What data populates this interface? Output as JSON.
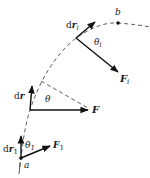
{
  "diagram": {
    "colors": {
      "ink": "#111111",
      "dash": "#333333",
      "background": "#ffffff"
    },
    "points": {
      "a": {
        "label": "a"
      },
      "b": {
        "label": "b"
      }
    },
    "vectors": {
      "dr1": {
        "label_main": "d",
        "label_vec": "r",
        "label_sub": "1"
      },
      "F1": {
        "label_vec": "F",
        "label_sub": "1"
      },
      "theta1": {
        "label_main": "θ",
        "label_sub": "1"
      },
      "dr": {
        "label_main": "d",
        "label_vec": "r"
      },
      "F": {
        "label_vec": "F"
      },
      "theta": {
        "label_main": "θ"
      },
      "dri": {
        "label_main": "d",
        "label_vec": "r",
        "label_sub": "i"
      },
      "Fi": {
        "label_vec": "F",
        "label_sub": "i"
      },
      "thetai": {
        "label_main": "θ",
        "label_sub": "i"
      }
    }
  }
}
